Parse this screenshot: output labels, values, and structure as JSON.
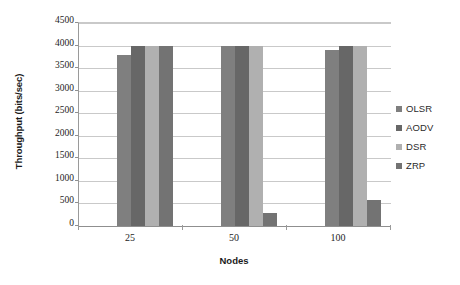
{
  "chart_data": {
    "type": "bar",
    "title": "",
    "xlabel": "Nodes",
    "ylabel": "Throughput (bits/sec)",
    "categories": [
      "25",
      "50",
      "100"
    ],
    "series": [
      {
        "name": "OLSR",
        "values": [
          3800,
          4000,
          3900
        ],
        "color": "#7f7f7f"
      },
      {
        "name": "AODV",
        "values": [
          4000,
          4000,
          4000
        ],
        "color": "#676767"
      },
      {
        "name": "DSR",
        "values": [
          4000,
          4000,
          4000
        ],
        "color": "#b0b0b0"
      },
      {
        "name": "ZRP",
        "values": [
          4000,
          280,
          580
        ],
        "color": "#737373"
      }
    ],
    "ylim": [
      0,
      4500
    ],
    "ytick_values": [
      0,
      500,
      1000,
      1500,
      2000,
      2500,
      3000,
      3500,
      4000,
      4500
    ],
    "ytick_labels": [
      "0",
      "500",
      "1000",
      "1500",
      "2000",
      "2500",
      "3000",
      "3500",
      "4000",
      "4500"
    ],
    "grid": true,
    "legend_position": "right",
    "legend_entries": [
      "OLSR",
      "AODV",
      "DSR",
      "ZRP"
    ],
    "annotations": []
  },
  "axes": {
    "y_title": "Throughput (bits/sec)",
    "x_title": "Nodes"
  },
  "legend": {
    "items": [
      {
        "label": "OLSR",
        "color": "#7f7f7f"
      },
      {
        "label": "AODV",
        "color": "#676767"
      },
      {
        "label": "DSR",
        "color": "#b0b0b0"
      },
      {
        "label": "ZRP",
        "color": "#737373"
      }
    ]
  },
  "ticks": {
    "y": [
      "4500",
      "4000",
      "3500",
      "3000",
      "2500",
      "2000",
      "1500",
      "1000",
      "500",
      "0"
    ],
    "x": [
      "25",
      "50",
      "100"
    ]
  }
}
